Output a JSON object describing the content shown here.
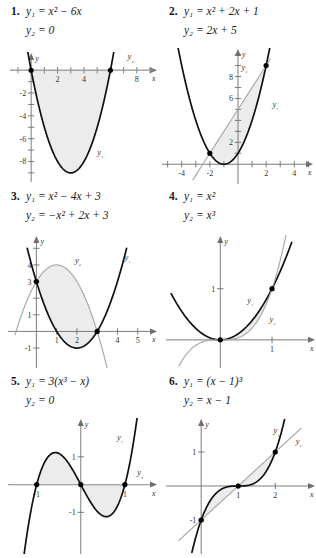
{
  "page": {
    "background": "#ffffff",
    "curve1_color": "#111111",
    "curve2_color": "#a8a8a8",
    "region_color": "#ececec",
    "axis_color": "#6e6e6e"
  },
  "panels": [
    {
      "number": "1.",
      "eq1": "y₁ = x² − 6x",
      "eq2": "y₂ = 0",
      "label1": "y₁",
      "label2": "y₂",
      "xaxis_label": "x",
      "yaxis_label": "y",
      "chart_data": {
        "type": "line",
        "title": "y1 = x^2 - 6x ; y2 = 0",
        "xlabel": "x",
        "ylabel": "y",
        "xlim": [
          -1.6,
          9.6
        ],
        "ylim": [
          -9.8,
          1.6
        ],
        "xticks": [
          -1,
          1,
          2,
          3,
          4,
          5,
          6,
          7,
          8,
          9
        ],
        "xticklabels": [
          [
            "2",
            2
          ],
          [
            "4",
            4
          ],
          [
            "8",
            8
          ]
        ],
        "yticks": [
          -1,
          -2,
          -3,
          -4,
          -5,
          -6,
          -7,
          -8,
          -9
        ],
        "yticklabels": [
          [
            "-2",
            -2
          ],
          [
            "-4",
            -4
          ],
          [
            "-6",
            -6
          ],
          [
            "-8",
            -8
          ]
        ],
        "series": [
          {
            "name": "y1",
            "expr": "x^2-6x",
            "kind": "quadratic",
            "a": 1,
            "b": -6,
            "c": 0,
            "domain": [
              -0.55,
              6.55
            ]
          },
          {
            "name": "y2",
            "expr": "0",
            "kind": "line",
            "m": 0,
            "k": 0,
            "domain": [
              -1.6,
              9.2
            ]
          }
        ],
        "intersections": [
          [
            0,
            0
          ],
          [
            6,
            0
          ]
        ],
        "shaded_between": [
          0,
          6
        ],
        "grid": false
      }
    },
    {
      "number": "2.",
      "eq1": "y₁ = x² + 2x + 1",
      "eq2": "y₂ = 2x + 5",
      "label1": "y₁",
      "label2": "y₂",
      "xaxis_label": "x",
      "yaxis_label": "y",
      "chart_data": {
        "type": "line",
        "title": "y1 = x^2+2x+1 ; y2 = 2x+5",
        "xlabel": "x",
        "ylabel": "y",
        "xlim": [
          -5.4,
          5.4
        ],
        "ylim": [
          -1.8,
          10.6
        ],
        "xticks": [
          -5,
          -4,
          -3,
          -2,
          -1,
          1,
          2,
          3,
          4,
          5
        ],
        "xticklabels": [
          [
            "-4",
            -4
          ],
          [
            "-2",
            -2
          ],
          [
            "2",
            2
          ],
          [
            "4",
            4
          ]
        ],
        "yticks": [
          1,
          2,
          3,
          4,
          5,
          6,
          7,
          8,
          9,
          10
        ],
        "yticklabels": [
          [
            "2",
            2
          ],
          [
            "6",
            6
          ],
          [
            "8",
            8
          ]
        ],
        "series": [
          {
            "name": "y1",
            "expr": "x^2+2x+1",
            "kind": "quadratic",
            "a": 1,
            "b": 2,
            "c": 1,
            "domain": [
              -4.3,
              2.25
            ]
          },
          {
            "name": "y2",
            "expr": "2x+5",
            "kind": "line",
            "m": 2,
            "k": 5,
            "domain": [
              -3.2,
              2.3
            ]
          }
        ],
        "intersections": [
          [
            -2,
            1
          ],
          [
            2,
            9
          ]
        ],
        "shaded_between": [
          -2,
          2
        ],
        "grid": false
      }
    },
    {
      "number": "3.",
      "eq1": "y₁ = x² − 4x + 3",
      "eq2": "y₂ = −x² + 2x + 3",
      "label1": "y₁",
      "label2": "y₂",
      "xaxis_label": "x",
      "yaxis_label": "y",
      "chart_data": {
        "type": "line",
        "title": "y1 = x^2-4x+3 ; y2 = -x^2+2x+3",
        "xlabel": "x",
        "ylabel": "y",
        "xlim": [
          -1.4,
          6.0
        ],
        "ylim": [
          -2.2,
          5.8
        ],
        "xticks": [
          1,
          2,
          3,
          4,
          5
        ],
        "xticklabels": [
          [
            "1",
            1
          ],
          [
            "2",
            2
          ],
          [
            "4",
            4
          ],
          [
            "5",
            5
          ]
        ],
        "yticks": [
          -1,
          1,
          2,
          3,
          4,
          5
        ],
        "yticklabels": [
          [
            "-1",
            -1
          ],
          [
            "1",
            1
          ],
          [
            "3",
            3
          ],
          [
            "4",
            4
          ]
        ],
        "series": [
          {
            "name": "y1",
            "expr": "x^2-4x+3",
            "kind": "quadratic",
            "a": 1,
            "b": -4,
            "c": 3,
            "domain": [
              -0.45,
              4.45
            ]
          },
          {
            "name": "y2",
            "expr": "-x^2+2x+3",
            "kind": "quadratic",
            "a": -1,
            "b": 2,
            "c": 3,
            "domain": [
              -1.05,
              3.5
            ]
          }
        ],
        "intersections": [
          [
            0,
            3
          ],
          [
            3,
            0
          ]
        ],
        "shaded_between": [
          0,
          3
        ],
        "grid": false
      }
    },
    {
      "number": "4.",
      "eq1": "y₁ = x²",
      "eq2": "y₂ = x³",
      "label1": "y₁",
      "label2": "y₂",
      "xaxis_label": "x",
      "yaxis_label": "y",
      "chart_data": {
        "type": "line",
        "title": "y1 = x^2 ; y2 = x^3",
        "xlabel": "x",
        "ylabel": "y",
        "xlim": [
          -1.05,
          1.85
        ],
        "ylim": [
          -0.55,
          2.05
        ],
        "xticks": [
          1
        ],
        "xticklabels": [
          [
            "1",
            1
          ]
        ],
        "yticks": [
          1
        ],
        "yticklabels": [
          [
            "1",
            1
          ]
        ],
        "series": [
          {
            "name": "y1",
            "expr": "x^2",
            "kind": "power",
            "p": 2,
            "domain": [
              -0.95,
              1.38
            ]
          },
          {
            "name": "y2",
            "expr": "x^3",
            "kind": "power",
            "p": 3,
            "domain": [
              -0.8,
              1.3
            ]
          }
        ],
        "intersections": [
          [
            0,
            0
          ],
          [
            1,
            1
          ]
        ],
        "shaded_between": [
          0,
          1
        ],
        "grid": false
      }
    },
    {
      "number": "5.",
      "eq1": "y₁ = 3(x³ − x)",
      "eq2": "y₂ = 0",
      "label1": "y₁",
      "label2": "y₂",
      "xaxis_label": "x",
      "yaxis_label": "y",
      "chart_data": {
        "type": "line",
        "title": "y1 = 3(x^3-x) ; y2 = 0",
        "xlabel": "x",
        "ylabel": "y",
        "xlim": [
          -1.65,
          1.75
        ],
        "ylim": [
          -2.5,
          2.4
        ],
        "xticks": [
          -1,
          1
        ],
        "xticklabels": [
          [
            "-1",
            -1
          ],
          [
            "1",
            1
          ]
        ],
        "yticks": [
          -1,
          1
        ],
        "yticklabels": [
          [
            "-1",
            -1
          ],
          [
            "1",
            1
          ]
        ],
        "series": [
          {
            "name": "y1",
            "expr": "3(x^3-x)",
            "kind": "cubic_odd",
            "k": 3,
            "domain": [
              -1.42,
              1.42
            ]
          },
          {
            "name": "y2",
            "expr": "0",
            "kind": "line",
            "m": 0,
            "k": 0,
            "domain": [
              -1.6,
              1.55
            ]
          }
        ],
        "intersections": [
          [
            -1,
            0
          ],
          [
            0,
            0
          ],
          [
            1,
            0
          ]
        ],
        "shaded_between": [
          -1,
          1
        ],
        "grid": false
      }
    },
    {
      "number": "6.",
      "eq1": "y₁ = (x − 1)³",
      "eq2": "y₂ = x − 1",
      "label1": "y₁",
      "label2": "y₂",
      "xaxis_label": "x",
      "yaxis_label": "y",
      "chart_data": {
        "type": "line",
        "title": "y1 = (x-1)^3 ; y2 = x-1",
        "xlabel": "x",
        "ylabel": "y",
        "xlim": [
          -0.95,
          3.1
        ],
        "ylim": [
          -2.0,
          2.0
        ],
        "xticks": [
          1,
          2
        ],
        "xticklabels": [
          [
            "1",
            1
          ],
          [
            "2",
            2
          ]
        ],
        "yticks": [
          -1,
          1
        ],
        "yticklabels": [
          [
            "-1",
            -1
          ],
          [
            "1",
            1
          ]
        ],
        "series": [
          {
            "name": "y1",
            "expr": "(x-1)^3",
            "kind": "shifted_cubic",
            "h": 1,
            "domain": [
              -0.25,
              2.25
            ]
          },
          {
            "name": "y2",
            "expr": "x-1",
            "kind": "line",
            "m": 1,
            "k": -1,
            "domain": [
              -0.6,
              2.7
            ]
          }
        ],
        "intersections": [
          [
            0,
            -1
          ],
          [
            1,
            0
          ],
          [
            2,
            1
          ]
        ],
        "shaded_between": [
          0,
          2
        ],
        "grid": false
      }
    }
  ]
}
